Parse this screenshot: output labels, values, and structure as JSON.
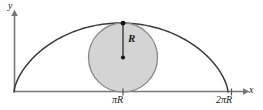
{
  "figure": {
    "caption": "",
    "background_color": "#ffffff",
    "stroke_color": "#3a3a3a",
    "axis_color": "#6e6e6e",
    "circle_fill_color": "#d2d2d2",
    "circle_stroke_color": "#8a8a8a",
    "labels": {
      "y_axis": "y",
      "x_axis": "x",
      "radius": "R",
      "tick_pi_r": "πR",
      "tick_two_pi_r": "2πR"
    },
    "geometry": {
      "origin_x": 14,
      "baseline_y": 92,
      "arch_peak_x": 123,
      "arch_peak_y": 23,
      "arch_end_x": 228,
      "circle_center_x": 123,
      "circle_center_y": 57.5,
      "circle_radius": 34.5,
      "y_axis_top": 12,
      "x_axis_right": 246
    }
  },
  "chart_data": {
    "type": "line",
    "title": "",
    "xlabel": "x",
    "ylabel": "y",
    "grid": false,
    "legend": null,
    "annotations": [
      {
        "name": "radius-label",
        "text": "R",
        "x": 123,
        "y": 40
      },
      {
        "name": "tick-label-pi-r",
        "text": "πR",
        "x": 123,
        "y": 0
      },
      {
        "name": "tick-label-2pi-r",
        "text": "2πR",
        "x": 228,
        "y": 0
      }
    ],
    "xticks": [
      "πR",
      "2πR"
    ],
    "xtick_values": [
      1,
      2
    ],
    "yticks": [],
    "series": [
      {
        "name": "cycloid-arch",
        "type": "line",
        "description": "One arch of a cycloid from (0,0) to (2πR,0) with peak (πR, 2R)",
        "x": [
          0,
          0.2,
          0.4,
          0.6,
          0.8,
          1.0,
          1.2,
          1.4,
          1.6,
          1.8,
          2.0
        ],
        "y": [
          0,
          0.69,
          1.27,
          1.68,
          1.92,
          2.0,
          1.92,
          1.68,
          1.27,
          0.69,
          0
        ]
      },
      {
        "name": "rolling-circle",
        "type": "circle",
        "description": "Generating circle of radius R tangent to the x-axis at πR and to the arch peak",
        "center": [
          1.0,
          1.0
        ],
        "radius": 1.0,
        "fill": "#d2d2d2"
      },
      {
        "name": "radius-segment",
        "type": "line",
        "description": "Vertical radius from circle center to arch peak",
        "x": [
          1.0,
          1.0
        ],
        "y": [
          1.0,
          2.0
        ]
      }
    ]
  }
}
